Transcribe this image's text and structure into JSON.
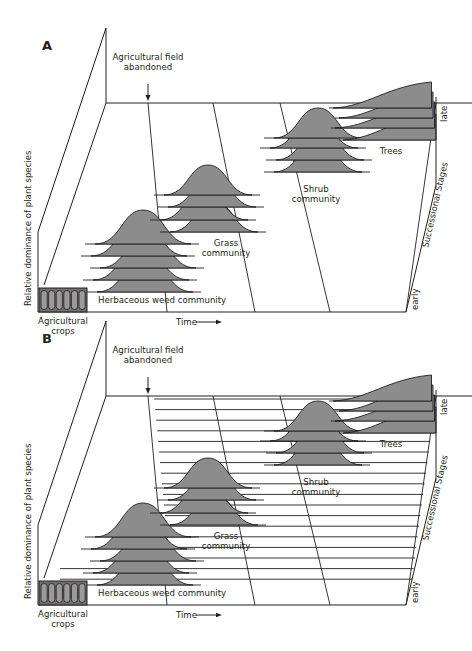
{
  "figure": {
    "panels": [
      {
        "id": "A",
        "letter": "A",
        "annotation_event": "Agricultural field\nabandoned",
        "y_axis_label": "Relative dominance of plant species",
        "x_axis_label": "Time",
        "depth_axis_label": "Successional Stages",
        "depth_start_label": "early",
        "depth_end_label": "late",
        "crops_label": "Agricultural\ncrops",
        "communities": [
          {
            "label": "Herbaceous weed community",
            "curves": 5,
            "shape": "bell"
          },
          {
            "label": "Grass\ncommunity",
            "curves": 4,
            "shape": "bell"
          },
          {
            "label": "Shrub\ncommunity",
            "curves": 4,
            "shape": "bell"
          },
          {
            "label": "Trees",
            "curves": 4,
            "shape": "rising"
          }
        ],
        "species_transect_lines": false
      },
      {
        "id": "B",
        "letter": "B",
        "annotation_event": "Agricultural field\nabandoned",
        "y_axis_label": "Relative dominance of plant species",
        "x_axis_label": "Time",
        "depth_axis_label": "Successional Stages",
        "depth_start_label": "early",
        "depth_end_label": "late",
        "crops_label": "Agricultural\ncrops",
        "communities": [
          {
            "label": "Herbaceous weed community",
            "curves": 5,
            "shape": "bell"
          },
          {
            "label": "Grass\ncommunity",
            "curves": 4,
            "shape": "bell"
          },
          {
            "label": "Shrub\ncommunity",
            "curves": 4,
            "shape": "bell"
          },
          {
            "label": "Trees",
            "curves": 4,
            "shape": "rising"
          }
        ],
        "species_transect_lines": true
      }
    ],
    "colors": {
      "line": "#231f20",
      "fill": "#8c8c8c",
      "crop_fill": "#6f6f6f"
    }
  }
}
